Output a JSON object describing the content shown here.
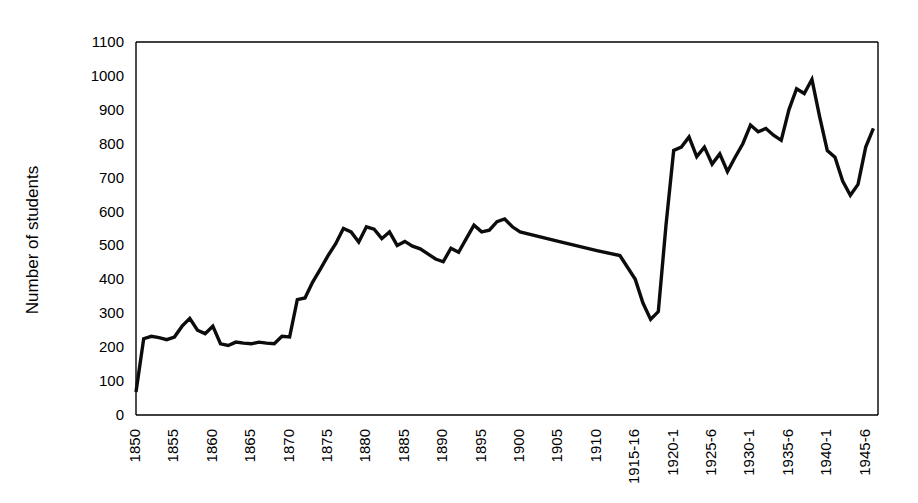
{
  "chart_data": {
    "type": "line",
    "title": "",
    "subtitle": "",
    "xlabel": "",
    "ylabel": "Number of students",
    "ylim": [
      0,
      1100
    ],
    "ytick_step": 100,
    "ytick_labels": [
      "0",
      "100",
      "200",
      "300",
      "400",
      "500",
      "600",
      "700",
      "800",
      "900",
      "1000",
      "1100"
    ],
    "xtick_labels": [
      "1850",
      "1855",
      "1860",
      "1865",
      "1870",
      "1875",
      "1880",
      "1885",
      "1890",
      "1895",
      "1900",
      "1905",
      "1910",
      "1915-16",
      "1920-1",
      "1925-6",
      "1930-1",
      "1935-6",
      "1940-1",
      "1945-6"
    ],
    "xtick_rotation_deg": -90,
    "grid": false,
    "legend": false,
    "legend_position": "none",
    "line_color": "#0c0c0c",
    "axis_color": "#000000",
    "background_color": "#ffffff",
    "x": [
      1850,
      1851,
      1852,
      1853,
      1854,
      1855,
      1856,
      1857,
      1858,
      1859,
      1860,
      1861,
      1862,
      1863,
      1864,
      1865,
      1866,
      1867,
      1868,
      1869,
      1870,
      1871,
      1872,
      1873,
      1874,
      1875,
      1876,
      1877,
      1878,
      1879,
      1880,
      1881,
      1882,
      1883,
      1884,
      1885,
      1886,
      1887,
      1888,
      1889,
      1890,
      1891,
      1892,
      1893,
      1894,
      1895,
      1896,
      1897,
      1898,
      1899,
      1900,
      1905,
      1910,
      1913,
      1915,
      1916,
      1917,
      1918,
      1919,
      1920,
      1921,
      1922,
      1923,
      1924,
      1925,
      1926,
      1927,
      1928,
      1929,
      1930,
      1931,
      1932,
      1933,
      1934,
      1935,
      1936,
      1937,
      1938,
      1939,
      1940,
      1941,
      1942,
      1943,
      1944,
      1945,
      1946
    ],
    "values": [
      68,
      225,
      232,
      228,
      222,
      230,
      262,
      285,
      250,
      240,
      262,
      210,
      205,
      215,
      212,
      210,
      215,
      212,
      210,
      232,
      230,
      340,
      345,
      392,
      430,
      470,
      505,
      550,
      540,
      510,
      555,
      548,
      520,
      540,
      500,
      512,
      498,
      490,
      475,
      460,
      452,
      492,
      480,
      520,
      560,
      540,
      545,
      570,
      578,
      555,
      540,
      512,
      485,
      470,
      400,
      330,
      282,
      305,
      560,
      780,
      790,
      820,
      762,
      790,
      740,
      770,
      718,
      760,
      800,
      855,
      835,
      845,
      825,
      810,
      900,
      962,
      948,
      990,
      880,
      780,
      760,
      690,
      648,
      680,
      790,
      845
    ],
    "series": [
      {
        "name": "Number of students",
        "values": [
          68,
          225,
          232,
          228,
          222,
          230,
          262,
          285,
          250,
          240,
          262,
          210,
          205,
          215,
          212,
          210,
          215,
          212,
          210,
          232,
          230,
          340,
          345,
          392,
          430,
          470,
          505,
          550,
          540,
          510,
          555,
          548,
          520,
          540,
          500,
          512,
          498,
          490,
          475,
          460,
          452,
          492,
          480,
          520,
          560,
          540,
          545,
          570,
          578,
          555,
          540,
          512,
          485,
          470,
          400,
          330,
          282,
          305,
          560,
          780,
          790,
          820,
          762,
          790,
          740,
          770,
          718,
          760,
          800,
          855,
          835,
          845,
          825,
          810,
          900,
          962,
          948,
          990,
          880,
          780,
          760,
          690,
          648,
          680,
          790,
          845
        ]
      }
    ]
  }
}
